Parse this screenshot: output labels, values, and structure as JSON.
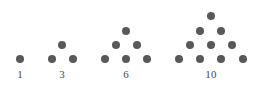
{
  "figure": {
    "name": "triangular-numbers-dot-diagram",
    "background_color": "#ffffff",
    "dot_color": "#595959",
    "label_color": "#4a4a4a",
    "dot_diameter": 8,
    "row_spacing": 14.3,
    "column_spacing": 21,
    "label_baseline_y": 69
  },
  "chart_data": {
    "type": "scatter",
    "title": "",
    "subtitle": "",
    "xlabel": "",
    "ylabel": "",
    "grid": false,
    "legend": null,
    "annotations": [
      "1",
      "3",
      "6",
      "10"
    ],
    "categories": [
      "1",
      "3",
      "6",
      "10"
    ],
    "values": [
      1,
      3,
      6,
      10
    ],
    "series": [
      {
        "name": "triangular-number-1",
        "label": "1",
        "rows": 1,
        "dot_count": 1,
        "label_x": 20,
        "label_y": 69,
        "points": [
          {
            "x": 20,
            "y": 59
          }
        ]
      },
      {
        "name": "triangular-number-3",
        "label": "3",
        "rows": 2,
        "dot_count": 3,
        "label_x": 62,
        "label_y": 69,
        "points": [
          {
            "x": 62,
            "y": 45
          },
          {
            "x": 52,
            "y": 59
          },
          {
            "x": 73,
            "y": 59
          }
        ]
      },
      {
        "name": "triangular-number-6",
        "label": "6",
        "rows": 3,
        "dot_count": 6,
        "label_x": 126,
        "label_y": 69,
        "points": [
          {
            "x": 126,
            "y": 31
          },
          {
            "x": 116,
            "y": 45
          },
          {
            "x": 137,
            "y": 45
          },
          {
            "x": 105,
            "y": 59
          },
          {
            "x": 126,
            "y": 59
          },
          {
            "x": 147,
            "y": 59
          }
        ]
      },
      {
        "name": "triangular-number-10",
        "label": "10",
        "rows": 4,
        "dot_count": 10,
        "label_x": 211,
        "label_y": 69,
        "points": [
          {
            "x": 211,
            "y": 16
          },
          {
            "x": 200,
            "y": 31
          },
          {
            "x": 221,
            "y": 31
          },
          {
            "x": 190,
            "y": 45
          },
          {
            "x": 211,
            "y": 45
          },
          {
            "x": 232,
            "y": 45
          },
          {
            "x": 179,
            "y": 59
          },
          {
            "x": 200,
            "y": 59
          },
          {
            "x": 221,
            "y": 59
          },
          {
            "x": 243,
            "y": 59
          }
        ]
      }
    ]
  }
}
